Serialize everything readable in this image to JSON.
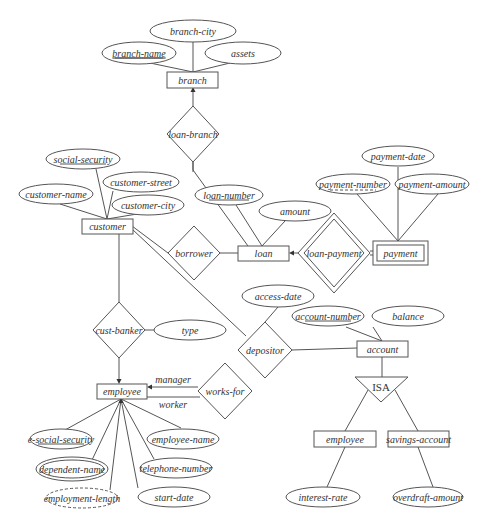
{
  "diagram": {
    "type": "entity-relationship",
    "entities": [
      {
        "id": "branch",
        "label": "branch",
        "weak": false
      },
      {
        "id": "customer",
        "label": "customer",
        "weak": false
      },
      {
        "id": "loan",
        "label": "loan",
        "weak": false
      },
      {
        "id": "payment",
        "label": "payment",
        "weak": true
      },
      {
        "id": "account",
        "label": "account",
        "weak": false
      },
      {
        "id": "employee",
        "label": "employee",
        "weak": false
      },
      {
        "id": "savings_account",
        "label": "savings-account",
        "weak": false
      },
      {
        "id": "checking_account",
        "label": "checking-account",
        "weak": false
      }
    ],
    "relationships": [
      {
        "id": "loan_branch",
        "label": "loan-branch",
        "identifying": false
      },
      {
        "id": "borrower",
        "label": "borrower",
        "identifying": false
      },
      {
        "id": "loan_payment",
        "label": "loan-payment",
        "identifying": true
      },
      {
        "id": "depositor",
        "label": "depositor",
        "identifying": false
      },
      {
        "id": "cust_banker",
        "label": "cust-banker",
        "identifying": false
      },
      {
        "id": "works_for",
        "label": "works-for",
        "identifying": false
      }
    ],
    "attributes": {
      "branch_city": "branch-city",
      "branch_name": "branch-name",
      "assets": "assets",
      "social_security": "social-security",
      "customer_name": "customer-name",
      "customer_street": "customer-street",
      "customer_city": "customer-city",
      "loan_number": "loan-number",
      "amount": "amount",
      "payment_date": "payment-date",
      "payment_number": "payment-number",
      "payment_amount": "payment-amount",
      "access_date": "access-date",
      "account_number": "account-number",
      "balance": "balance",
      "type": "type",
      "e_social_security": "e-social-security",
      "employee_name": "employee-name",
      "dependent_name": "dependent-name",
      "telephone_number": "telephone-number",
      "employment_length": "employment-length",
      "start_date": "start-date",
      "interest_rate": "interest-rate",
      "overdraft_amount": "overdraft-amount"
    },
    "roles": {
      "manager": "manager",
      "worker": "worker"
    },
    "isa_label": "ISA"
  }
}
